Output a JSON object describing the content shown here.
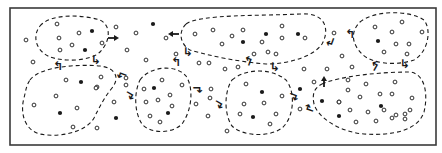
{
  "diagram": {
    "type": "cluster-diagram",
    "colors": {
      "ink": "#1a1a1a",
      "frame": "#3a3a3a",
      "background": "#ffffff"
    },
    "frame": {
      "x": 10,
      "y": 8,
      "w": 426,
      "h": 137
    },
    "clusters": [
      {
        "id": "c1",
        "path": "M40,26 C50,14 80,14 100,20 C112,26 110,42 100,52 C90,62 60,62 48,56 C36,50 32,36 40,26 Z"
      },
      {
        "id": "c2",
        "path": "M186,24 C200,14 260,16 300,14 C326,12 330,30 322,44 C314,56 290,64 266,64 C240,62 210,56 190,50 C180,44 178,32 186,24 Z"
      },
      {
        "id": "c3",
        "path": "M360,22 C374,10 410,10 424,20 C432,30 428,52 414,60 C396,66 372,64 362,54 C352,44 350,32 360,22 Z"
      },
      {
        "id": "c4",
        "path": "M30,80 C40,66 80,64 100,66 C116,68 120,78 112,88 C104,98 100,106 94,118 C86,132 60,138 40,134 C24,130 20,112 24,98 C26,90 26,86 30,80 Z"
      },
      {
        "id": "c5",
        "path": "M140,80 C150,66 176,64 186,76 C194,88 192,110 182,124 C172,134 150,134 142,124 C134,112 134,92 140,80 Z"
      },
      {
        "id": "c6",
        "path": "M232,80 C246,68 272,68 286,80 C296,92 294,118 282,128 C268,138 242,136 232,126 C224,114 224,92 232,80 Z"
      },
      {
        "id": "c7",
        "path": "M322,84 C340,76 380,72 410,72 C426,74 428,96 424,112 C418,130 394,136 364,134 C340,132 318,118 314,104 C312,94 314,88 322,84 Z"
      }
    ],
    "open_particles": [
      [
        26,
        40
      ],
      [
        57,
        24
      ],
      [
        79,
        33
      ],
      [
        59,
        38
      ],
      [
        72,
        45
      ],
      [
        60,
        50
      ],
      [
        102,
        43
      ],
      [
        116,
        27
      ],
      [
        136,
        33
      ],
      [
        127,
        50
      ],
      [
        33,
        62
      ],
      [
        146,
        60
      ],
      [
        166,
        38
      ],
      [
        195,
        34
      ],
      [
        213,
        30
      ],
      [
        222,
        44
      ],
      [
        232,
        36
      ],
      [
        243,
        30
      ],
      [
        282,
        26
      ],
      [
        262,
        42
      ],
      [
        282,
        38
      ],
      [
        305,
        38
      ],
      [
        276,
        54
      ],
      [
        254,
        54
      ],
      [
        268,
        52
      ],
      [
        176,
        54
      ],
      [
        199,
        63
      ],
      [
        209,
        63
      ],
      [
        225,
        69
      ],
      [
        238,
        67
      ],
      [
        304,
        69
      ],
      [
        327,
        69
      ],
      [
        334,
        33
      ],
      [
        342,
        56
      ],
      [
        352,
        67
      ],
      [
        375,
        27
      ],
      [
        392,
        32
      ],
      [
        402,
        22
      ],
      [
        409,
        44
      ],
      [
        422,
        32
      ],
      [
        396,
        44
      ],
      [
        384,
        52
      ],
      [
        407,
        54
      ],
      [
        66,
        80
      ],
      [
        101,
        77
      ],
      [
        56,
        96
      ],
      [
        97,
        87
      ],
      [
        34,
        105
      ],
      [
        77,
        108
      ],
      [
        73,
        127
      ],
      [
        97,
        128
      ],
      [
        114,
        102
      ],
      [
        126,
        78
      ],
      [
        126,
        85
      ],
      [
        96,
        88
      ],
      [
        144,
        89
      ],
      [
        162,
        80
      ],
      [
        182,
        85
      ],
      [
        146,
        102
      ],
      [
        158,
        100
      ],
      [
        170,
        95
      ],
      [
        172,
        106
      ],
      [
        150,
        116
      ],
      [
        160,
        122
      ],
      [
        211,
        89
      ],
      [
        210,
        98
      ],
      [
        196,
        104
      ],
      [
        208,
        116
      ],
      [
        227,
        131
      ],
      [
        246,
        84
      ],
      [
        282,
        96
      ],
      [
        244,
        104
      ],
      [
        264,
        103
      ],
      [
        240,
        114
      ],
      [
        276,
        114
      ],
      [
        270,
        124
      ],
      [
        314,
        82
      ],
      [
        300,
        109
      ],
      [
        339,
        102
      ],
      [
        348,
        90
      ],
      [
        366,
        84
      ],
      [
        395,
        82
      ],
      [
        348,
        80
      ],
      [
        339,
        102
      ],
      [
        360,
        97
      ],
      [
        380,
        94
      ],
      [
        392,
        94
      ],
      [
        412,
        98
      ],
      [
        350,
        110
      ],
      [
        368,
        112
      ],
      [
        384,
        110
      ],
      [
        405,
        114
      ],
      [
        396,
        115
      ],
      [
        410,
        110
      ],
      [
        356,
        122
      ],
      [
        376,
        121
      ],
      [
        392,
        118
      ],
      [
        405,
        119
      ]
    ],
    "filled_particles": [
      [
        92,
        31
      ],
      [
        85,
        50
      ],
      [
        153,
        24
      ],
      [
        266,
        34
      ],
      [
        243,
        42
      ],
      [
        298,
        34
      ],
      [
        378,
        41
      ],
      [
        81,
        82
      ],
      [
        60,
        113
      ],
      [
        116,
        118
      ],
      [
        154,
        88
      ],
      [
        168,
        113
      ],
      [
        262,
        92
      ],
      [
        253,
        117
      ],
      [
        300,
        89
      ],
      [
        322,
        101
      ],
      [
        339,
        116
      ],
      [
        381,
        106
      ]
    ],
    "arrows": [
      {
        "label": "straight-right",
        "x": 113,
        "y": 38,
        "dir": "right"
      },
      {
        "label": "straight-left",
        "x": 174,
        "y": 34,
        "dir": "left"
      },
      {
        "label": "straight-up",
        "x": 324,
        "y": 82,
        "dir": "up"
      }
    ],
    "exchange_glyphs": [
      {
        "x": 58,
        "y": 66,
        "char": "↰",
        "rot": 0
      },
      {
        "x": 96,
        "y": 60,
        "char": "↳",
        "rot": 0
      },
      {
        "x": 122,
        "y": 76,
        "char": "↰",
        "rot": -70
      },
      {
        "x": 130,
        "y": 96,
        "char": "↲",
        "rot": -60
      },
      {
        "x": 176,
        "y": 62,
        "char": "↰",
        "rot": 0
      },
      {
        "x": 188,
        "y": 52,
        "char": "↳",
        "rot": 0
      },
      {
        "x": 198,
        "y": 90,
        "char": "↲",
        "rot": -90
      },
      {
        "x": 219,
        "y": 105,
        "char": "↲",
        "rot": -60
      },
      {
        "x": 248,
        "y": 61,
        "char": "↰",
        "rot": 20
      },
      {
        "x": 275,
        "y": 67,
        "char": "↳",
        "rot": 0
      },
      {
        "x": 294,
        "y": 97,
        "char": "↲",
        "rot": -70
      },
      {
        "x": 310,
        "y": 108,
        "char": "↱",
        "rot": -70
      },
      {
        "x": 330,
        "y": 42,
        "char": "↲",
        "rot": 20
      },
      {
        "x": 350,
        "y": 34,
        "char": "↰",
        "rot": 0
      },
      {
        "x": 374,
        "y": 66,
        "char": "↰",
        "rot": 30
      },
      {
        "x": 405,
        "y": 64,
        "char": "↳",
        "rot": 0
      }
    ]
  }
}
